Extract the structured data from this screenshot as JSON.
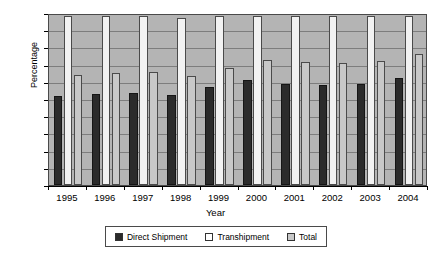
{
  "chart_data": {
    "type": "bar",
    "title": "",
    "xlabel": "Year",
    "ylabel": "Percentage",
    "ylim": [
      0,
      100
    ],
    "ytick_step": 10,
    "yticks": [
      0,
      10,
      20,
      30,
      40,
      50,
      60,
      70,
      80,
      90,
      100
    ],
    "grid": true,
    "legend_position": "bottom",
    "categories": [
      "1995",
      "1996",
      "1997",
      "1998",
      "1999",
      "2000",
      "2001",
      "2002",
      "2003",
      "2004"
    ],
    "series": [
      {
        "name": "Direct Shipment",
        "color": "#2b2b2b",
        "values": [
          52,
          53,
          53.5,
          52.5,
          57,
          61,
          58.5,
          58,
          58.5,
          62
        ]
      },
      {
        "name": "Transhipment",
        "color": "#f2f2f2",
        "values": [
          98,
          98,
          98,
          97,
          98,
          98,
          98,
          98,
          98,
          98
        ]
      },
      {
        "name": "Total",
        "color": "#c8c8c8",
        "values": [
          64,
          65,
          65.5,
          63.5,
          68,
          72.5,
          71.5,
          71,
          72,
          76
        ]
      }
    ]
  },
  "legend": {
    "items": [
      {
        "label": "Direct Shipment",
        "swatch": "direct"
      },
      {
        "label": "Transhipment",
        "swatch": "trans"
      },
      {
        "label": "Total",
        "swatch": "total"
      }
    ]
  }
}
